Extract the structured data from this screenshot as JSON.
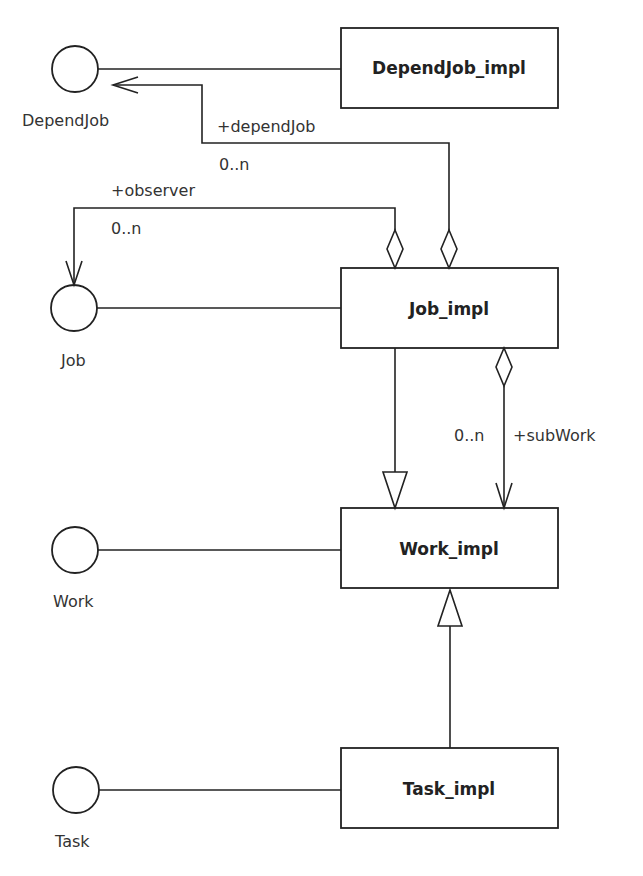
{
  "diagram": {
    "type": "UML class diagram",
    "classes": [
      {
        "id": "dependjob_impl",
        "name": "DependJob_impl"
      },
      {
        "id": "job_impl",
        "name": "Job_impl"
      },
      {
        "id": "work_impl",
        "name": "Work_impl"
      },
      {
        "id": "task_impl",
        "name": "Task_impl"
      }
    ],
    "interfaces": [
      {
        "id": "dependjob",
        "name": "DependJob"
      },
      {
        "id": "job",
        "name": "Job"
      },
      {
        "id": "work",
        "name": "Work"
      },
      {
        "id": "task",
        "name": "Task"
      }
    ],
    "realizations": [
      {
        "from": "DependJob_impl",
        "to": "DependJob"
      },
      {
        "from": "Job_impl",
        "to": "Job"
      },
      {
        "from": "Work_impl",
        "to": "Work"
      },
      {
        "from": "Task_impl",
        "to": "Task"
      }
    ],
    "generalizations": [
      {
        "from": "Job_impl",
        "to": "Work_impl"
      },
      {
        "from": "Task_impl",
        "to": "Work_impl"
      }
    ],
    "aggregations": [
      {
        "whole": "Job_impl",
        "part": "DependJob",
        "role": "+dependJob",
        "multiplicity": "0..n"
      },
      {
        "whole": "Job_impl",
        "part": "Job",
        "role": "+observer",
        "multiplicity": "0..n"
      },
      {
        "whole": "Job_impl",
        "part": "Work_impl",
        "role": "+subWork",
        "multiplicity": "0..n"
      }
    ]
  },
  "labels": {
    "dependjob_impl": "DependJob_impl",
    "job_impl": "Job_impl",
    "work_impl": "Work_impl",
    "task_impl": "Task_impl",
    "dependjob": "DependJob",
    "job": "Job",
    "work": "Work",
    "task": "Task",
    "role_dependjob": "+dependJob",
    "mult_dependjob": "0..n",
    "role_observer": "+observer",
    "mult_observer": "0..n",
    "role_subwork": "+subWork",
    "mult_subwork": "0..n"
  }
}
